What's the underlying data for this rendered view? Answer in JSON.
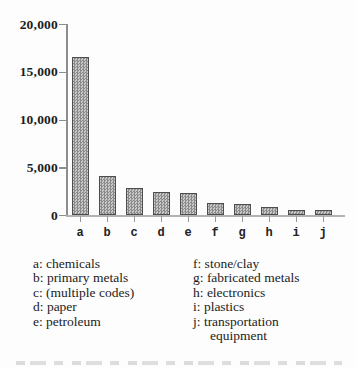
{
  "chart_data": {
    "type": "bar",
    "categories": [
      "a",
      "b",
      "c",
      "d",
      "e",
      "f",
      "g",
      "h",
      "i",
      "j"
    ],
    "values": [
      16500,
      4100,
      2800,
      2400,
      2300,
      1300,
      1100,
      850,
      550,
      500
    ],
    "title": "",
    "xlabel": "",
    "ylabel": "",
    "ylim": [
      0,
      20000
    ],
    "yticks": [
      0,
      5000,
      10000,
      15000,
      20000
    ],
    "ytick_labels": [
      "0",
      "5,000",
      "10,000",
      "15,000",
      "20,000"
    ],
    "grid": false,
    "legend_position": "below-chart",
    "bar_fill": "gray-crosshatch"
  },
  "legend": {
    "left_items": [
      "a: chemicals",
      "b: primary metals",
      "c: (multiple codes)",
      "d: paper",
      "e: petroleum"
    ],
    "right_items": [
      "f: stone/clay",
      "g: fabricated metals",
      "h: electronics",
      "i: plastics",
      "j: transportation",
      "equipment"
    ]
  },
  "colors": {
    "background": "#fdfdfd",
    "text": "#1c1c1c",
    "axis": "#8d8d8d",
    "baseline": "#b3b3b3",
    "bar_dark": "#8b8b8b",
    "bar_light": "#c9c9c9",
    "bar_border": "#4e4e4e"
  }
}
